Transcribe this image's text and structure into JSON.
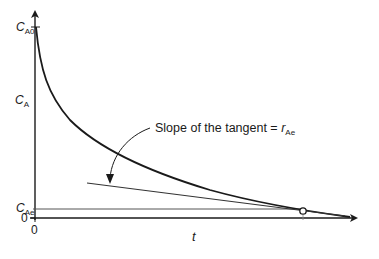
{
  "figure": {
    "y_axis": {
      "label_var": "C",
      "label_sub": "A",
      "top_tick_var": "C",
      "top_tick_sub": "A0",
      "eq_tick_var": "C",
      "eq_tick_sub": "Ae",
      "zero": "0"
    },
    "x_axis": {
      "label": "t",
      "zero": "0"
    },
    "annotation": {
      "text": "Slope of the tangent = ",
      "var": "r",
      "sub": "Ae"
    },
    "colors": {
      "line": "#1a1a1a",
      "tangent": "#333333",
      "background": "#ffffff"
    }
  }
}
